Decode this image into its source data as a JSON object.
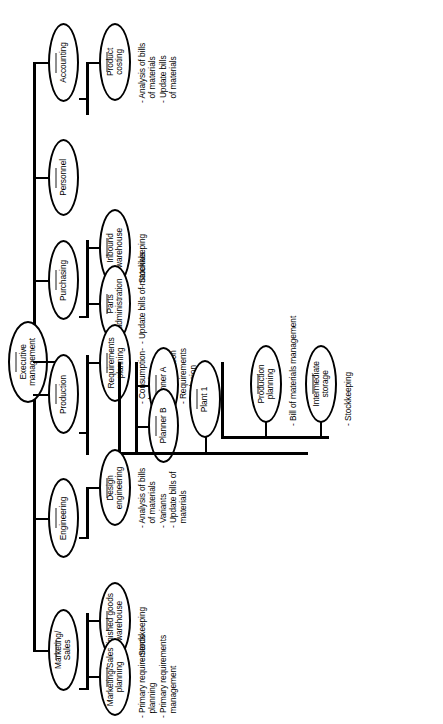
{
  "diagram": {
    "orientation": "rotated-90-ccw",
    "stroke_color": "#000000",
    "divider_color": "#8e8e8e",
    "background": "#ffffff",
    "root": {
      "label": "Executive\nmanagement"
    },
    "level1": [
      {
        "label": "Accounting"
      },
      {
        "label": "Personnel"
      },
      {
        "label": "Purchasing"
      },
      {
        "label": "Production"
      },
      {
        "label": "Engineering"
      },
      {
        "label": "Marketing/\nSales"
      }
    ],
    "level2": [
      {
        "label": "Product\ncosting"
      },
      {
        "label": "Inbound\nwarehouse"
      },
      {
        "label": "Parts\nadministration"
      },
      {
        "label": "Requirements\nplanning"
      },
      {
        "label": "Planner A"
      },
      {
        "label": "Planner B"
      },
      {
        "label": "Plant 1"
      },
      {
        "label": "Production\nplanning"
      },
      {
        "label": "Intermediate\nstorage"
      },
      {
        "label": "Design\nengineering"
      },
      {
        "label": "Finished goods\nwarehouse"
      },
      {
        "label": "Marketing/Sales\nplanning"
      }
    ],
    "functions": {
      "product_costing": "- Analysis of bills\n  of materials\n- Update bills\n  of materials",
      "inbound_warehouse": "- Stockkeeping",
      "parts_administration": "- Update bills of materials",
      "requirements_planning": "- Consumption-\n  based\n  requirements\n  determination\n- Requirements\n  explosion\n- Lot sizing",
      "production_planning": "- Bill of materials management",
      "intermediate_storage": "- Stockkeeping",
      "design_engineering": "- Analysis of bills\n  of materials\n- Variants\n- Update bills of\n  materials",
      "finished_goods_warehouse": "- Stockkeeping",
      "marketing_sales_planning": "- Primary requirements\n  planning\n- Primary requirements\n  management"
    }
  }
}
